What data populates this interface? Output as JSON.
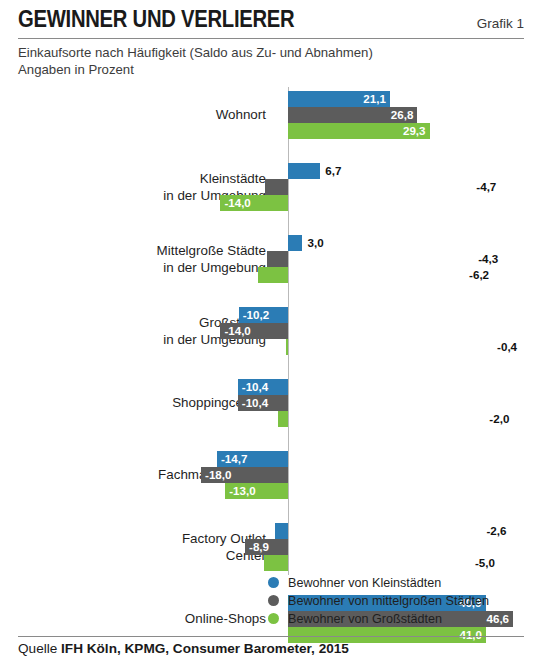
{
  "header": {
    "title": "GEWINNER UND VERLIERER",
    "figure_number": "Grafik 1",
    "subtitle_line1": "Einkaufsorte nach Häufigkeit (Saldo aus Zu- und Abnahmen)",
    "subtitle_line2": "Angaben in Prozent"
  },
  "source": {
    "prefix": "Quelle ",
    "text": "IFH Köln, KPMG, Consumer Barometer, 2015"
  },
  "legend": {
    "items": [
      {
        "label": "Bewohner von Kleinstädten",
        "color": "#2b7cb5",
        "key": "kleinstaedte"
      },
      {
        "label": "Bewohner von mittelgroßen Städten",
        "color": "#5c5c5c",
        "key": "mittelgrosse"
      },
      {
        "label": "Bewohner von Großstädten",
        "color": "#7cc242",
        "key": "grossstaedte"
      }
    ]
  },
  "chart_data": {
    "type": "bar",
    "orientation": "horizontal",
    "title": "GEWINNER UND VERLIERER",
    "subtitle": "Einkaufsorte nach Häufigkeit (Saldo aus Zu- und Abnahmen) Angaben in Prozent",
    "xlabel": "",
    "ylabel": "",
    "unit": "%",
    "xlim": [
      -20,
      50
    ],
    "grid": false,
    "zero_line": true,
    "legend_position": "bottom-center",
    "decimal_separator": ",",
    "categories": [
      "Wohnort",
      "Kleinstädte\nin der Umgebung",
      "Mittelgroße Städte\nin der Umgebung",
      "Großstädte\nin der Umgebung",
      "Shoppingcenter",
      "Fachmarktzentren",
      "Factory Outlet\nCenter",
      "Online-Shops"
    ],
    "series": [
      {
        "name": "Bewohner von Kleinstädten",
        "color": "#2b7cb5",
        "values": [
          21.1,
          6.7,
          3.0,
          -10.2,
          -10.4,
          -14.7,
          -2.6,
          40.9
        ],
        "labels": [
          "21,1",
          "6,7",
          "3,0",
          "-10,2",
          "-10,4",
          "-14,7",
          "-2,6",
          "40,9"
        ]
      },
      {
        "name": "Bewohner von mittelgroßen Städten",
        "color": "#5c5c5c",
        "values": [
          26.8,
          -4.7,
          -4.3,
          -14.0,
          -10.4,
          -18.0,
          -8.9,
          46.6
        ],
        "labels": [
          "26,8",
          "-4,7",
          "-4,3",
          "-14,0",
          "-10,4",
          "-18,0",
          "-8,9",
          "46,6"
        ]
      },
      {
        "name": "Bewohner von Großstädten",
        "color": "#7cc242",
        "values": [
          29.3,
          -14.0,
          -6.2,
          -0.4,
          -2.0,
          -13.0,
          -5.0,
          41.0
        ],
        "labels": [
          "29,3",
          "-14,0",
          "-6,2",
          "-0,4",
          "-2,0",
          "-13,0",
          "-5,0",
          "41,0"
        ]
      }
    ]
  }
}
